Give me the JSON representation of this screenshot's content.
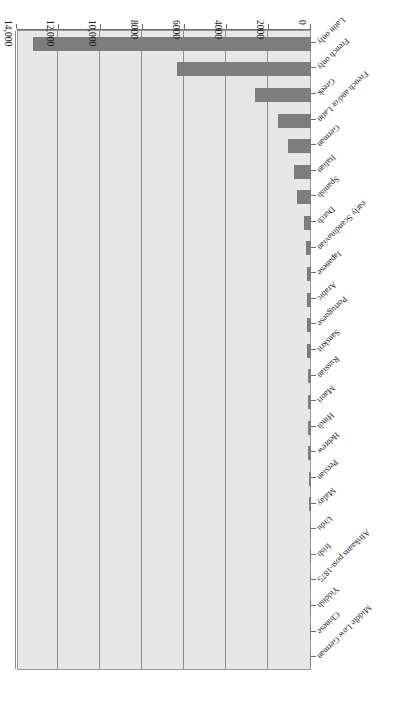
{
  "chart_data": {
    "type": "bar",
    "orientation": "horizontal",
    "title": "",
    "subtitle": "",
    "xlabel": "",
    "ylabel": "",
    "xlim": [
      0,
      14000
    ],
    "grid": true,
    "legend": null,
    "rotated_180": true,
    "axis_ticks": [
      "0",
      "2000",
      "4000",
      "6000",
      "8000",
      "10,000",
      "12,000",
      "14,000"
    ],
    "axis_tick_values": [
      0,
      2000,
      4000,
      6000,
      8000,
      10000,
      12000,
      14000
    ],
    "categories": [
      "Latin only",
      "French only",
      "Greek",
      "French and/or Latin",
      "German",
      "Italian",
      "Spanish",
      "Dutch",
      "early Scandinavian",
      "Japanese",
      "Arabic",
      "Portuguese",
      "Sanskrit",
      "Russian",
      "Maori",
      "Hindi",
      "Hebrew",
      "Persian",
      "Malay",
      "Urdu",
      "Irish",
      "Afrikaans post-1875",
      "Yiddish",
      "Chinese",
      "Middle Low German"
    ],
    "values": [
      13240,
      6380,
      2660,
      1570,
      1100,
      790,
      690,
      330,
      240,
      210,
      190,
      180,
      170,
      150,
      140,
      130,
      120,
      110,
      95,
      70,
      55,
      45,
      40,
      30,
      25
    ],
    "colors": {
      "bar": "#7d7d7d",
      "plot_background": "#e7e7e7",
      "gridline": "#8d8d8d",
      "axis": "#6e6e6e",
      "text": "#1a1a1a",
      "page_background": "#ffffff"
    }
  }
}
